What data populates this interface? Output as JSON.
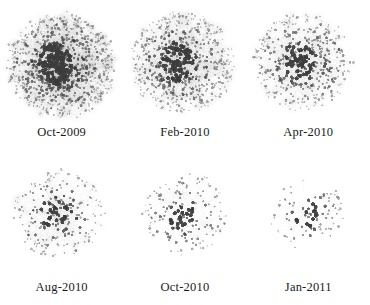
{
  "figure": {
    "background_color": "#ffffff",
    "node_color": "#3c3c3c",
    "edge_color": "#c8c8c8",
    "caption_color": "#1a1a1a",
    "layout": {
      "rows": 2,
      "cols": 3
    }
  },
  "chart_data": {
    "type": "scatter",
    "title": "",
    "xlabel": "",
    "ylabel": "",
    "grid": false,
    "legend": "none",
    "panels": [
      {
        "label": "Oct-2009",
        "row": 1,
        "col": 1,
        "node_count": 940,
        "edge_count": 2600,
        "radius": 54,
        "core_density": 0.95,
        "seed": 11,
        "haze_opacity": 0.5,
        "core_x": -0.02,
        "core_y": 0.04
      },
      {
        "label": "Feb-2010",
        "row": 1,
        "col": 2,
        "node_count": 620,
        "edge_count": 1700,
        "radius": 52,
        "core_density": 0.8,
        "seed": 23,
        "haze_opacity": 0.42,
        "core_x": -0.05,
        "core_y": 0.0
      },
      {
        "label": "Apr-2010",
        "row": 1,
        "col": 3,
        "node_count": 420,
        "edge_count": 1050,
        "radius": 50,
        "core_density": 0.66,
        "seed": 37,
        "haze_opacity": 0.34,
        "core_x": -0.08,
        "core_y": -0.02
      },
      {
        "label": "Aug-2010",
        "row": 2,
        "col": 1,
        "node_count": 230,
        "edge_count": 520,
        "radius": 46,
        "core_density": 0.5,
        "seed": 53,
        "haze_opacity": 0.26,
        "core_x": -0.06,
        "core_y": 0.0
      },
      {
        "label": "Oct-2010",
        "row": 2,
        "col": 2,
        "node_count": 165,
        "edge_count": 340,
        "radius": 42,
        "core_density": 0.42,
        "seed": 71,
        "haze_opacity": 0.2,
        "core_x": 0.0,
        "core_y": 0.0
      },
      {
        "label": "Jan-2011",
        "row": 2,
        "col": 3,
        "node_count": 88,
        "edge_count": 150,
        "radius": 38,
        "core_density": 0.32,
        "seed": 97,
        "haze_opacity": 0.14,
        "core_x": 0.02,
        "core_y": 0.0
      }
    ]
  }
}
